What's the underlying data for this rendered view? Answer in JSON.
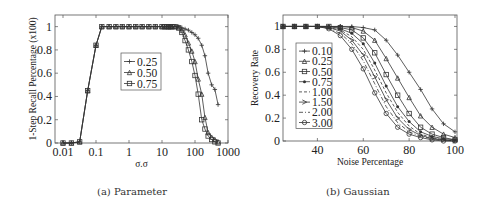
{
  "chart_data": [
    {
      "type": "line",
      "title": "",
      "caption": "(a) Parameter",
      "xlabel": "σ.σ",
      "ylabel": "1-Step Recall Percentage (x100)",
      "xscale": "log",
      "xlim": [
        0.0056,
        1000
      ],
      "ylim": [
        0,
        1.1
      ],
      "xticks": [
        "0.01",
        "0.1",
        "1",
        "10",
        "100",
        "1000"
      ],
      "yticks": [
        "0",
        "0.2",
        "0.4",
        "0.6",
        "0.8",
        "1"
      ],
      "legend_position": "center",
      "series": [
        {
          "name": "0.25",
          "marker": "plus",
          "x": [
            0.01,
            0.018,
            0.032,
            0.056,
            0.1,
            0.15,
            0.25,
            0.4,
            0.63,
            1,
            1.6,
            2.5,
            4,
            6.3,
            10,
            12,
            14,
            16,
            18,
            20,
            25,
            32,
            40,
            50,
            63,
            80,
            100,
            125,
            160,
            200,
            250,
            320,
            400,
            500
          ],
          "y": [
            0,
            0,
            0.01,
            0.45,
            0.84,
            1,
            1,
            1,
            1,
            1,
            1,
            1,
            1,
            1,
            1,
            1,
            1,
            1,
            1,
            1,
            1,
            1,
            0.99,
            0.98,
            0.97,
            0.95,
            0.93,
            0.9,
            0.84,
            0.75,
            0.6,
            0.5,
            0.46,
            0.33
          ]
        },
        {
          "name": "0.50",
          "marker": "triangle",
          "x": [
            0.01,
            0.018,
            0.032,
            0.056,
            0.1,
            0.15,
            0.25,
            0.4,
            0.63,
            1,
            1.6,
            2.5,
            4,
            6.3,
            10,
            12,
            14,
            16,
            18,
            20,
            25,
            32,
            40,
            50,
            63,
            80,
            100,
            125,
            160,
            200,
            250,
            320,
            400,
            500
          ],
          "y": [
            0,
            0,
            0.01,
            0.45,
            0.84,
            1,
            1,
            1,
            1,
            1,
            1,
            1,
            1,
            1,
            1,
            1,
            1,
            1,
            1,
            1,
            1,
            0.99,
            0.97,
            0.93,
            0.86,
            0.79,
            0.7,
            0.55,
            0.42,
            0.22,
            0.09,
            0.05,
            0.03,
            0.01
          ]
        },
        {
          "name": "0.75",
          "marker": "square",
          "x": [
            0.01,
            0.018,
            0.032,
            0.056,
            0.1,
            0.15,
            0.25,
            0.4,
            0.63,
            1,
            1.6,
            2.5,
            4,
            6.3,
            10,
            12,
            14,
            16,
            18,
            20,
            25,
            32,
            40,
            50,
            63,
            80,
            100,
            125,
            160,
            200,
            250,
            320,
            400,
            500
          ],
          "y": [
            0,
            0,
            0.01,
            0.45,
            0.84,
            1,
            1,
            1,
            1,
            1,
            1,
            1,
            1,
            1,
            1,
            1,
            1,
            1,
            1,
            1,
            1,
            0.99,
            0.95,
            0.88,
            0.8,
            0.7,
            0.58,
            0.42,
            0.2,
            0.12,
            0.06,
            0.03,
            0.01,
            0
          ]
        }
      ]
    },
    {
      "type": "line",
      "title": "",
      "caption": "(b) Gaussian",
      "xlabel": "Noise Percentage",
      "ylabel": "Recovery Rate",
      "xlim": [
        25,
        100
      ],
      "ylim": [
        0,
        1.1
      ],
      "xticks": [
        "40",
        "60",
        "80",
        "100"
      ],
      "yticks": [
        "0",
        "0.2",
        "0.4",
        "0.6",
        "0.8",
        "1"
      ],
      "legend_position": "center-left",
      "series": [
        {
          "name": "0.10",
          "marker": "plus",
          "x": [
            25,
            30,
            35,
            40,
            45,
            50,
            55,
            60,
            65,
            70,
            75,
            80,
            85,
            90,
            95,
            100
          ],
          "y": [
            1,
            1,
            1,
            1,
            1,
            1,
            1,
            0.99,
            0.97,
            0.88,
            0.75,
            0.6,
            0.45,
            0.28,
            0.15,
            0.08
          ]
        },
        {
          "name": "0.25",
          "marker": "triangle",
          "x": [
            25,
            30,
            35,
            40,
            45,
            50,
            55,
            60,
            65,
            70,
            75,
            80,
            85,
            90,
            95,
            100
          ],
          "y": [
            1,
            1,
            1,
            1,
            1,
            1,
            0.99,
            0.96,
            0.88,
            0.72,
            0.55,
            0.38,
            0.22,
            0.12,
            0.06,
            0.03
          ]
        },
        {
          "name": "0.50",
          "marker": "square",
          "x": [
            25,
            30,
            35,
            40,
            45,
            50,
            55,
            60,
            65,
            70,
            75,
            80,
            85,
            90,
            95,
            100
          ],
          "y": [
            1,
            1,
            1,
            1,
            1,
            0.99,
            0.97,
            0.9,
            0.77,
            0.58,
            0.4,
            0.24,
            0.12,
            0.06,
            0.03,
            0.01
          ]
        },
        {
          "name": "0.75",
          "marker": "dot",
          "x": [
            25,
            30,
            35,
            40,
            45,
            50,
            55,
            60,
            65,
            70,
            75,
            80,
            85,
            90,
            95,
            100
          ],
          "y": [
            1,
            1,
            1,
            1,
            1,
            0.98,
            0.94,
            0.85,
            0.68,
            0.48,
            0.3,
            0.17,
            0.08,
            0.04,
            0.02,
            0.01
          ]
        },
        {
          "name": "1.00",
          "marker": "dash",
          "x": [
            25,
            30,
            35,
            40,
            45,
            50,
            55,
            60,
            65,
            70,
            75,
            80,
            85,
            90,
            95,
            100
          ],
          "y": [
            1,
            1,
            1,
            1,
            0.99,
            0.97,
            0.91,
            0.8,
            0.62,
            0.42,
            0.25,
            0.13,
            0.06,
            0.03,
            0.01,
            0
          ]
        },
        {
          "name": "1.50",
          "marker": "arrow",
          "x": [
            25,
            30,
            35,
            40,
            45,
            50,
            55,
            60,
            65,
            70,
            75,
            80,
            85,
            90,
            95,
            100
          ],
          "y": [
            1,
            1,
            1,
            1,
            0.99,
            0.96,
            0.88,
            0.75,
            0.56,
            0.36,
            0.2,
            0.1,
            0.05,
            0.02,
            0.01,
            0
          ]
        },
        {
          "name": "2.00",
          "marker": "dashdot",
          "x": [
            25,
            30,
            35,
            40,
            45,
            50,
            55,
            60,
            65,
            70,
            75,
            80,
            85,
            90,
            95,
            100
          ],
          "y": [
            1,
            1,
            1,
            1,
            0.98,
            0.94,
            0.85,
            0.7,
            0.5,
            0.3,
            0.16,
            0.08,
            0.04,
            0.02,
            0.01,
            0
          ]
        },
        {
          "name": "3.00",
          "marker": "circle",
          "x": [
            25,
            30,
            35,
            40,
            45,
            50,
            55,
            60,
            65,
            70,
            75,
            80,
            85,
            90,
            95,
            100
          ],
          "y": [
            1,
            1,
            1,
            1,
            0.98,
            0.92,
            0.8,
            0.63,
            0.42,
            0.24,
            0.12,
            0.06,
            0.03,
            0.01,
            0,
            0
          ]
        }
      ]
    }
  ],
  "panels": {
    "a": {
      "caption": "(a) Parameter",
      "ylabel": "1-Step Recall Percentage (x100)",
      "xlabel": "σ.σ"
    },
    "b": {
      "caption": "(b) Gaussian",
      "ylabel": "Recovery Rate",
      "xlabel": "Noise Percentage"
    }
  },
  "colors": {
    "line": "#333333",
    "axis": "#555555",
    "text": "#222222"
  }
}
